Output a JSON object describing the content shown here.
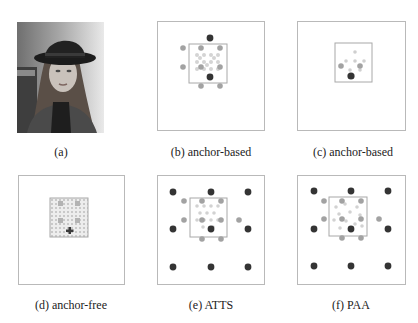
{
  "figure": {
    "panels": [
      {
        "id": "a",
        "label": "(a)",
        "type": "photo",
        "description": "grayscale portrait of a woman wearing a black bowler hat"
      },
      {
        "id": "b",
        "label": "(b) anchor-based"
      },
      {
        "id": "c",
        "label": "(c) anchor-based"
      },
      {
        "id": "d",
        "label": "(d) anchor-free"
      },
      {
        "id": "e",
        "label": "(e) ATTS"
      },
      {
        "id": "f",
        "label": "(f) PAA"
      }
    ],
    "colors": {
      "border": "#b9b9b9",
      "dark_point": "#3a3a3a",
      "mid_point": "#9a9a9a",
      "light_point": "#d2d2d2",
      "label": "#222222"
    }
  }
}
